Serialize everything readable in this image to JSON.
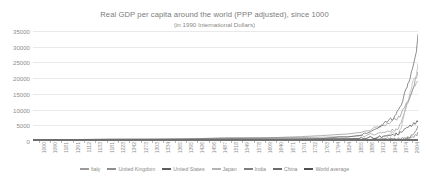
{
  "chart_data": {
    "type": "line",
    "title": "Real GDP per capita around the world (PPP adjusted), since 1000",
    "subtitle": "(in 1990 International Dollars)",
    "xlabel": "",
    "ylabel": "",
    "ylim": [
      0,
      35000
    ],
    "yticks": [
      0,
      5000,
      10000,
      15000,
      20000,
      25000,
      30000,
      35000
    ],
    "ytick_labels": [
      "0",
      "5000",
      "10000",
      "15000",
      "20000",
      "25000",
      "30000",
      "35000"
    ],
    "grid": "horizontal",
    "legend_position": "bottom",
    "xlim": [
      1000,
      2004
    ],
    "x_tick_labels": [
      "1000",
      "1090",
      "1181",
      "1291",
      "1112",
      "1133",
      "1181",
      "1223",
      "1342",
      "1273",
      "1303",
      "1334",
      "1365",
      "1395",
      "1426",
      "1456",
      "1487",
      "1518",
      "1549",
      "1578",
      "1609",
      "1640",
      "1671",
      "1701",
      "1732",
      "1763",
      "1794",
      "1824",
      "1855",
      "1886",
      "1912",
      "1943",
      "1974",
      "2004"
    ],
    "x": [
      1000,
      1100,
      1200,
      1300,
      1400,
      1500,
      1600,
      1700,
      1750,
      1800,
      1820,
      1850,
      1870,
      1900,
      1913,
      1929,
      1940,
      1950,
      1960,
      1973,
      1980,
      1990,
      2000,
      2004
    ],
    "series": [
      {
        "name": "Italy",
        "color": "#9a9a9a",
        "values": [
          450,
          450,
          500,
          550,
          600,
          1100,
          1100,
          1100,
          1200,
          1350,
          1400,
          1550,
          1800,
          2500,
          2800,
          3100,
          3500,
          3500,
          5900,
          10600,
          13100,
          16300,
          18700,
          19100
        ]
      },
      {
        "name": "United Kingdom",
        "color": "#8e8e8e",
        "values": [
          400,
          420,
          500,
          550,
          650,
          750,
          950,
          1400,
          1700,
          2100,
          2200,
          2700,
          3200,
          4500,
          4900,
          5500,
          6900,
          6900,
          8600,
          12000,
          12900,
          16400,
          20400,
          22000
        ]
      },
      {
        "name": "United States",
        "color": "#5d5d5d",
        "values": [
          400,
          400,
          400,
          400,
          400,
          400,
          400,
          500,
          700,
          1300,
          1250,
          1800,
          2400,
          4100,
          5300,
          6900,
          7000,
          9560,
          11300,
          16700,
          18600,
          23200,
          28500,
          34000
        ]
      },
      {
        "name": "Japan",
        "color": "#b4b4b4",
        "values": [
          425,
          425,
          425,
          425,
          500,
          500,
          520,
          570,
          620,
          670,
          670,
          680,
          740,
          1180,
          1390,
          2030,
          2870,
          1920,
          3990,
          11400,
          13400,
          18800,
          21100,
          24700
        ]
      },
      {
        "name": "India",
        "color": "#7f7f7f",
        "values": [
          450,
          450,
          450,
          450,
          550,
          550,
          550,
          550,
          540,
          530,
          530,
          530,
          530,
          600,
          670,
          730,
          690,
          620,
          750,
          850,
          940,
          1310,
          1900,
          2500
        ]
      },
      {
        "name": "China",
        "color": "#6b6b6b",
        "values": [
          450,
          450,
          600,
          600,
          600,
          600,
          600,
          600,
          600,
          600,
          600,
          600,
          530,
          550,
          550,
          560,
          560,
          450,
          670,
          840,
          1060,
          1870,
          3420,
          4800
        ]
      },
      {
        "name": "World average",
        "color": "#4f4f4f",
        "values": [
          435,
          440,
          450,
          460,
          500,
          560,
          600,
          620,
          650,
          670,
          670,
          790,
          870,
          1260,
          1520,
          1810,
          1960,
          2110,
          2770,
          4090,
          4520,
          5150,
          6040,
          6500
        ]
      }
    ]
  }
}
